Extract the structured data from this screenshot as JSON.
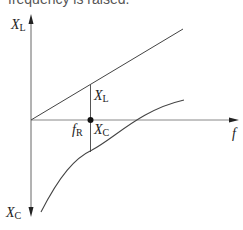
{
  "caption": "frequency is raised.",
  "diagram": {
    "type": "reactance-vs-frequency",
    "axes": {
      "horizontal_label": "f",
      "vertical_top_label": {
        "main": "X",
        "sub": "L"
      },
      "vertical_bottom_label": {
        "main": "X",
        "sub": "C"
      }
    },
    "curves": [
      {
        "name": "inductive-reactance",
        "label": {
          "main": "X",
          "sub": "L"
        },
        "shape": "line"
      },
      {
        "name": "capacitive-reactance",
        "label": {
          "main": "X",
          "sub": "C"
        },
        "shape": "hyperbola"
      }
    ],
    "resonance_point": {
      "label": {
        "main": "f",
        "sub": "R"
      }
    },
    "colors": {
      "line": "#333333",
      "axis": "#555555"
    }
  }
}
